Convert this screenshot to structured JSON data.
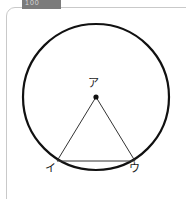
{
  "frame": {
    "tab_label": "100",
    "tab_color": "#7b7b7b",
    "border_color": "#c9c9c9",
    "background_color": "#ffffff"
  },
  "figure": {
    "type": "geometry-diagram",
    "stroke_color": "#111111",
    "circle": {
      "center_x": 96,
      "center_y": 97,
      "radius": 73,
      "stroke_width": 2.2
    },
    "center_point": {
      "x": 96,
      "y": 97,
      "radius": 2.6,
      "label": "ア"
    },
    "triangle": {
      "stroke_width": 1,
      "vertices": [
        {
          "label": "ア",
          "x": 96,
          "y": 97
        },
        {
          "label": "イ",
          "x": 57,
          "y": 161
        },
        {
          "label": "ウ",
          "x": 135,
          "y": 161
        }
      ]
    },
    "labels": {
      "center": "ア",
      "left": "イ",
      "right": "ウ"
    }
  }
}
